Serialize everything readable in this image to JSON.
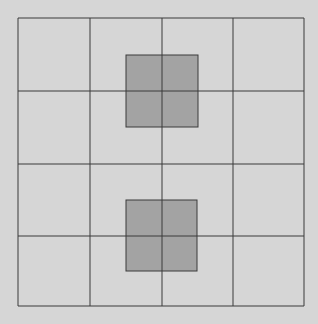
{
  "diagram": {
    "type": "grid",
    "rows": 4,
    "cols": 4,
    "background": "#d6d6d6",
    "line_color": "#3a3a3a",
    "shade_color": "#a3a3a3",
    "grid_bounds": {
      "x0": 18,
      "y0": 18,
      "x1": 304,
      "y1": 306
    },
    "col_lines": [
      18,
      90,
      162,
      233,
      304
    ],
    "row_lines": [
      18,
      91,
      164,
      236,
      306
    ],
    "shaded_squares": [
      {
        "x": 126,
        "y": 55,
        "w": 72,
        "h": 72
      },
      {
        "x": 126,
        "y": 200,
        "w": 71,
        "h": 71
      }
    ]
  }
}
